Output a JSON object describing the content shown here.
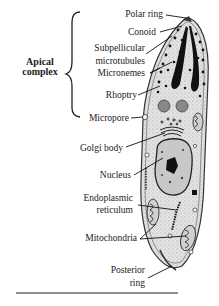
{
  "diagram": {
    "group_label": {
      "line1": "Apical",
      "line2": "complex"
    },
    "labels": {
      "polar_ring": "Polar ring",
      "conoid": "Conoid",
      "subpellicular_1": "Subpellicular",
      "subpellicular_2": "microtubules",
      "micronemes": "Micronemes",
      "rhoptry": "Rhoptry",
      "micropore": "Micropore",
      "golgi": "Golgi body",
      "nucleus": "Nucleus",
      "er_1": "Endoplasmic",
      "er_2": "reticulum",
      "mitochondria": "Mitochondria",
      "posterior_1": "Posterior",
      "posterior_2": "ring"
    },
    "colors": {
      "outline": "#333333",
      "cytoplasm": "#d9d9d9",
      "dark": "#111111",
      "organelle": "#8a8a8a"
    }
  }
}
